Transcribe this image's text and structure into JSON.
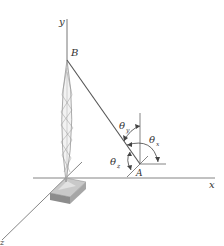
{
  "diagram": {
    "type": "3D statics - tower with guy cable",
    "axes": {
      "x_label": "x",
      "y_label": "y",
      "z_label": "z"
    },
    "points": {
      "top": "B",
      "anchor": "A"
    },
    "angles": {
      "theta_x": "θx",
      "theta_y": "θy",
      "theta_z": "θz"
    },
    "angle_labels": {
      "theta": "θ",
      "x_sub": "x",
      "y_sub": "y",
      "z_sub": "z"
    },
    "colors": {
      "line": "#555555",
      "text": "#333333",
      "base_top": "#c8c8c8",
      "base_side": "#8a8a8a"
    }
  }
}
